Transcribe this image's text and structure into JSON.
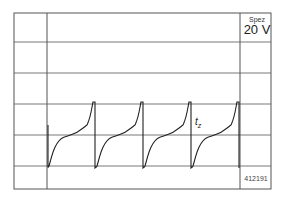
{
  "panel": {
    "range_label": "Spez",
    "range_value": "20 V",
    "figure_id": "412191",
    "marker_label": "t",
    "marker_sub": "z"
  },
  "grid": {
    "left": 14,
    "top": 13,
    "right": 271,
    "bottom": 189,
    "col_lines": [
      47,
      240
    ],
    "row_lines": [
      42,
      73,
      104,
      135,
      166
    ],
    "line_color": "#555555"
  },
  "waveform": {
    "color": "#222222",
    "periods": [
      {
        "start_x": 48,
        "peak_x": 93
      },
      {
        "start_x": 96,
        "peak_x": 141
      },
      {
        "start_x": 144,
        "peak_x": 189
      },
      {
        "start_x": 192,
        "peak_x": 237
      }
    ],
    "low_y": 167,
    "mid_y": 135,
    "high_y": 102
  }
}
